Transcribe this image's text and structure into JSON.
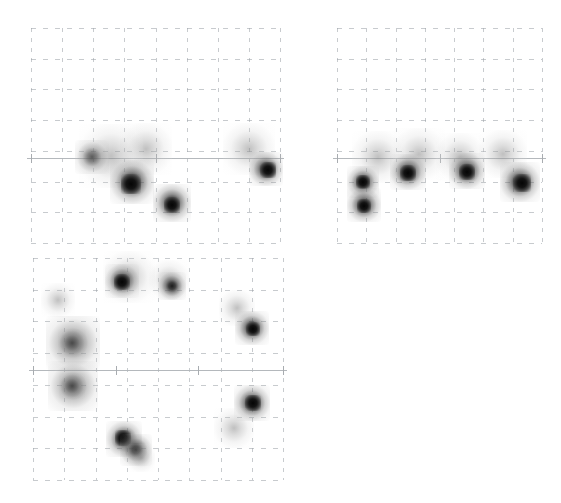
{
  "figure": {
    "title": "",
    "background_color": "#ffffff",
    "grid_color": "#9aa0a6",
    "axis_color": "#b0b4b8",
    "blob_color": "#141414",
    "panel_count": 3
  },
  "chart_data": {
    "type": "scatter",
    "title": "",
    "subtitle": "",
    "xlabel": "",
    "ylabel": "",
    "grid": "dashed",
    "legend": "none",
    "panels": [
      {
        "name": "panel-top-left",
        "x": 31,
        "y": 28,
        "width": 249,
        "height": 215,
        "grid_cols": 8,
        "grid_rows": 7,
        "axis_y_frac": 0.605,
        "axis_ticks_frac": [
          0.0,
          0.5,
          1.0
        ],
        "xlim": [
          0,
          8
        ],
        "ylim": [
          0,
          7
        ],
        "points": [
          {
            "x": 0.46,
            "y": 0.565,
            "r": 26,
            "intensity": "light"
          },
          {
            "x": 0.32,
            "y": 0.595,
            "r": 32,
            "intensity": "light"
          },
          {
            "x": 0.245,
            "y": 0.6,
            "r": 17,
            "intensity": "medium"
          },
          {
            "x": 0.405,
            "y": 0.715,
            "r": 22,
            "intensity": "dark"
          },
          {
            "x": 0.4,
            "y": 0.725,
            "r": 10,
            "intensity": "core"
          },
          {
            "x": 0.565,
            "y": 0.815,
            "r": 19,
            "intensity": "dark"
          },
          {
            "x": 0.565,
            "y": 0.825,
            "r": 8,
            "intensity": "core"
          },
          {
            "x": 0.875,
            "y": 0.565,
            "r": 26,
            "intensity": "light"
          },
          {
            "x": 0.945,
            "y": 0.655,
            "r": 17,
            "intensity": "dark"
          },
          {
            "x": 0.95,
            "y": 0.66,
            "r": 8,
            "intensity": "core"
          }
        ]
      },
      {
        "name": "panel-top-right",
        "x": 337,
        "y": 28,
        "width": 205,
        "height": 215,
        "grid_cols": 7,
        "grid_rows": 7,
        "axis_y_frac": 0.605,
        "axis_ticks_frac": [
          0.0,
          0.5,
          1.0
        ],
        "xlim": [
          0,
          7
        ],
        "ylim": [
          0,
          7
        ],
        "points": [
          {
            "x": 0.2,
            "y": 0.6,
            "r": 26,
            "intensity": "light"
          },
          {
            "x": 0.4,
            "y": 0.585,
            "r": 26,
            "intensity": "light"
          },
          {
            "x": 0.6,
            "y": 0.6,
            "r": 24,
            "intensity": "light"
          },
          {
            "x": 0.81,
            "y": 0.585,
            "r": 24,
            "intensity": "light"
          },
          {
            "x": 0.125,
            "y": 0.715,
            "r": 16,
            "intensity": "dark"
          },
          {
            "x": 0.125,
            "y": 0.715,
            "r": 7,
            "intensity": "core"
          },
          {
            "x": 0.13,
            "y": 0.825,
            "r": 17,
            "intensity": "dark"
          },
          {
            "x": 0.13,
            "y": 0.83,
            "r": 7,
            "intensity": "core"
          },
          {
            "x": 0.345,
            "y": 0.67,
            "r": 18,
            "intensity": "dark"
          },
          {
            "x": 0.345,
            "y": 0.675,
            "r": 8,
            "intensity": "core"
          },
          {
            "x": 0.635,
            "y": 0.665,
            "r": 18,
            "intensity": "dark"
          },
          {
            "x": 0.635,
            "y": 0.67,
            "r": 8,
            "intensity": "core"
          },
          {
            "x": 0.895,
            "y": 0.715,
            "r": 20,
            "intensity": "dark"
          },
          {
            "x": 0.9,
            "y": 0.72,
            "r": 9,
            "intensity": "core"
          }
        ]
      },
      {
        "name": "panel-bottom-left",
        "x": 33,
        "y": 258,
        "width": 250,
        "height": 222,
        "grid_cols": 8,
        "grid_rows": 7,
        "axis_y_frac": 0.505,
        "axis_ticks_frac": [
          0.0,
          0.33,
          0.66,
          1.0
        ],
        "xlim": [
          0,
          8
        ],
        "ylim": [
          0,
          7
        ],
        "points": [
          {
            "x": 0.385,
            "y": 0.085,
            "r": 26,
            "intensity": "light"
          },
          {
            "x": 0.355,
            "y": 0.105,
            "r": 17,
            "intensity": "dark"
          },
          {
            "x": 0.355,
            "y": 0.11,
            "r": 8,
            "intensity": "core"
          },
          {
            "x": 0.545,
            "y": 0.1,
            "r": 20,
            "intensity": "light"
          },
          {
            "x": 0.555,
            "y": 0.125,
            "r": 14,
            "intensity": "dark"
          },
          {
            "x": 0.1,
            "y": 0.19,
            "r": 17,
            "intensity": "light"
          },
          {
            "x": 0.16,
            "y": 0.385,
            "r": 27,
            "intensity": "medium"
          },
          {
            "x": 0.155,
            "y": 0.385,
            "r": 14,
            "intensity": "medium"
          },
          {
            "x": 0.16,
            "y": 0.575,
            "r": 25,
            "intensity": "medium"
          },
          {
            "x": 0.155,
            "y": 0.575,
            "r": 13,
            "intensity": "medium"
          },
          {
            "x": 0.815,
            "y": 0.225,
            "r": 18,
            "intensity": "light"
          },
          {
            "x": 0.875,
            "y": 0.315,
            "r": 17,
            "intensity": "dark"
          },
          {
            "x": 0.88,
            "y": 0.32,
            "r": 7,
            "intensity": "core"
          },
          {
            "x": 0.875,
            "y": 0.655,
            "r": 18,
            "intensity": "dark"
          },
          {
            "x": 0.88,
            "y": 0.655,
            "r": 8,
            "intensity": "core"
          },
          {
            "x": 0.805,
            "y": 0.765,
            "r": 20,
            "intensity": "light"
          },
          {
            "x": 0.365,
            "y": 0.815,
            "r": 18,
            "intensity": "dark"
          },
          {
            "x": 0.36,
            "y": 0.81,
            "r": 8,
            "intensity": "core"
          },
          {
            "x": 0.41,
            "y": 0.865,
            "r": 16,
            "intensity": "dark"
          },
          {
            "x": 0.43,
            "y": 0.9,
            "r": 14,
            "intensity": "light"
          }
        ]
      }
    ]
  }
}
